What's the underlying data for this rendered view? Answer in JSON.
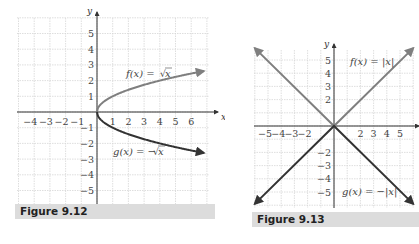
{
  "chart_data": [
    {
      "type": "line",
      "figure_label": "Figure 9.12",
      "xlabel": "x",
      "ylabel": "y",
      "xlim": [
        -5,
        7
      ],
      "ylim": [
        -6,
        6
      ],
      "grid": true,
      "x_tick_labels": [
        "−4",
        "−3",
        "−2",
        "−1",
        "1",
        "2",
        "3",
        "4",
        "5",
        "6"
      ],
      "y_tick_labels": [
        "5",
        "4",
        "3",
        "2",
        "1",
        "−1",
        "−2",
        "−3",
        "−4",
        "−5"
      ],
      "series": [
        {
          "name": "f(x) = √x",
          "color": "#7f7f7f",
          "x": [
            0,
            1,
            2,
            3,
            4,
            5,
            6,
            6.8
          ],
          "y": [
            0,
            1,
            1.41,
            1.73,
            2,
            2.24,
            2.45,
            2.61
          ]
        },
        {
          "name": "g(x) = −√x",
          "color": "#333333",
          "x": [
            0,
            1,
            2,
            3,
            4,
            5,
            6,
            6.8
          ],
          "y": [
            0,
            -1,
            -1.41,
            -1.73,
            -2,
            -2.24,
            -2.45,
            -2.61
          ]
        }
      ],
      "annotations": [
        {
          "text_func": "f(x) = ",
          "text_arg": "x",
          "near": [
            3,
            2.6
          ]
        },
        {
          "text_func": "g(x) = −",
          "text_arg": "x",
          "near": [
            3,
            -2.6
          ]
        }
      ]
    },
    {
      "type": "line",
      "figure_label": "Figure 9.13",
      "xlabel": "x",
      "ylabel": "y",
      "xlim": [
        -6,
        6
      ],
      "ylim": [
        -6,
        6
      ],
      "grid": true,
      "x_tick_labels": [
        "−5",
        "−4",
        "−3",
        "−2",
        "2",
        "3",
        "4",
        "5"
      ],
      "y_tick_labels": [
        "5",
        "4",
        "3",
        "2",
        "−2",
        "−3",
        "−4",
        "−5"
      ],
      "series": [
        {
          "name": "f(x) = |x|",
          "color": "#7f7f7f",
          "x": [
            -6,
            0,
            6
          ],
          "y": [
            6,
            0,
            6
          ]
        },
        {
          "name": "g(x) = −|x|",
          "color": "#333333",
          "x": [
            -6,
            0,
            6
          ],
          "y": [
            -6,
            0,
            -6
          ]
        }
      ],
      "annotations": [
        {
          "text": "f(x) = |x|",
          "near": [
            2.5,
            5
          ]
        },
        {
          "text": "g(x) = −|x|",
          "near": [
            2.5,
            -5
          ]
        }
      ]
    }
  ],
  "labels": {
    "fig1": {
      "caption": "Figure 9.12",
      "x_axis": "x",
      "y_axis": "y",
      "f_label": "f(x) = ",
      "f_arg": "x",
      "g_label": "g(x) = −",
      "g_arg": "x"
    },
    "fig2": {
      "caption": "Figure 9.13",
      "x_axis": "x",
      "y_axis": "y",
      "f_label": "f(x) = |x|",
      "g_label": "g(x) = −|x|"
    }
  }
}
